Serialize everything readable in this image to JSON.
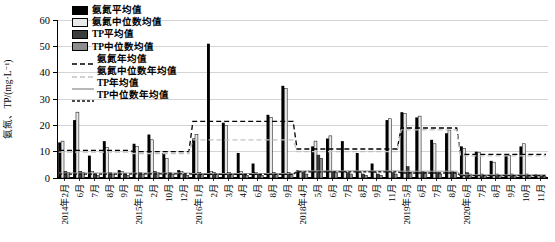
{
  "chart_data": {
    "type": "bar",
    "title": "",
    "xlabel": "",
    "ylabel": "氨氮、TP/(mg·L⁻¹)",
    "ylim": [
      0,
      60
    ],
    "yticks": [
      0,
      10,
      20,
      30,
      40,
      50,
      60
    ],
    "grid": true,
    "legend_position": "top-left-inside",
    "categories": [
      "2014年2月",
      "6月",
      "7月",
      "8月",
      "9月",
      "2015年1月",
      "2月",
      "10月",
      "12月",
      "2016年1月",
      "2月",
      "3月",
      "4月",
      "6月",
      "8月",
      "9月",
      "2018年4月",
      "5月",
      "6月",
      "7月",
      "8月",
      "9月",
      "11月",
      "2019年5月",
      "6月",
      "7月",
      "8月",
      "2020年6月",
      "7月",
      "8月",
      "9月",
      "10月",
      "11月"
    ],
    "year_spans": [
      {
        "year": "2014",
        "from": 0,
        "to": 4
      },
      {
        "year": "2015",
        "from": 5,
        "to": 8
      },
      {
        "year": "2016",
        "from": 9,
        "to": 15
      },
      {
        "year": "2018",
        "from": 16,
        "to": 22
      },
      {
        "year": "2019",
        "from": 23,
        "to": 26
      },
      {
        "year": "2020",
        "from": 27,
        "to": 32
      }
    ],
    "series": [
      {
        "name": "氨氮平均值",
        "kind": "bar",
        "color": "#000000",
        "values": [
          13.5,
          22,
          8.5,
          14,
          3,
          13,
          16.5,
          9.5,
          3,
          15,
          51,
          21,
          9.5,
          5.5,
          24,
          35,
          3,
          12,
          15,
          14,
          9.5,
          5.5,
          22,
          25,
          23,
          14.5,
          17,
          12,
          10,
          6.5,
          9,
          12,
          1.5
        ]
      },
      {
        "name": "氨氮中位数均值",
        "kind": "bar",
        "color": "#e9e9e9",
        "values": [
          14,
          25,
          2.5,
          11.5,
          2.5,
          12,
          14.5,
          7.5,
          2.5,
          16.5,
          2.5,
          20,
          2.5,
          2,
          23,
          34,
          2.5,
          14,
          16,
          2.5,
          2,
          2,
          22.5,
          24.5,
          23.5,
          13,
          18,
          11.3,
          9.8,
          6,
          8.5,
          13,
          1
        ]
      },
      {
        "name": "TP平均值",
        "kind": "bar",
        "color": "#3c3c3c",
        "values": [
          2.5,
          2.5,
          1.5,
          2,
          1.5,
          2,
          2.5,
          2,
          1.5,
          2,
          2,
          2,
          1.5,
          1.5,
          2,
          2,
          2,
          8.7,
          2.5,
          2,
          1.5,
          1.5,
          2,
          4.3,
          2.5,
          2,
          2.5,
          2,
          1.5,
          1.5,
          1.5,
          1.5,
          0.8
        ]
      },
      {
        "name": "TP中位数均值",
        "kind": "bar",
        "color": "#8d8d8d",
        "values": [
          2,
          2,
          1,
          1.5,
          1,
          1.5,
          2,
          1.5,
          1,
          1.5,
          1.5,
          1.5,
          1,
          1,
          1.5,
          1.5,
          1.5,
          7.5,
          2,
          1.5,
          1,
          1,
          1.5,
          2,
          2,
          1.5,
          2,
          1.5,
          1,
          1,
          1,
          1,
          0.5
        ]
      },
      {
        "name": "氨氮年均值",
        "kind": "line",
        "style": "dashed",
        "color": "#000000",
        "year_values": [
          10.5,
          10,
          21.5,
          11,
          19,
          9
        ]
      },
      {
        "name": "氨氮中位数年均值",
        "kind": "line",
        "style": "dashed",
        "color": "#c2c2c2",
        "year_values": [
          9.8,
          9.3,
          14.5,
          10,
          18.3,
          8.4
        ]
      },
      {
        "name": "TP年均值",
        "kind": "line",
        "style": "solid",
        "color": "#9a9a9a",
        "year_values": [
          1.9,
          1.9,
          1.7,
          2.7,
          2.6,
          1.2
        ]
      },
      {
        "name": "TP中位数年均值",
        "kind": "line",
        "style": "dashed-dense",
        "color": "#111111",
        "year_values": [
          1.5,
          1.6,
          1.4,
          2.3,
          1.9,
          0.9
        ]
      }
    ]
  }
}
